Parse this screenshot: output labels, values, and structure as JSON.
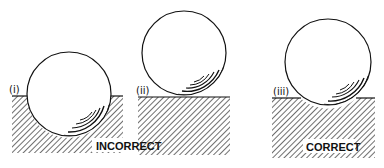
{
  "panels": [
    {
      "label": "(i)",
      "description": "ball sunk deep into surface"
    },
    {
      "label": "(ii)",
      "description": "ball resting on surface"
    },
    {
      "label": "(iii)",
      "description": "ball slightly embedded in surface"
    }
  ],
  "captions": {
    "incorrect": "INCORRECT",
    "correct": "CORRECT"
  },
  "colors": {
    "ink": "#111111",
    "background": "#ffffff"
  }
}
